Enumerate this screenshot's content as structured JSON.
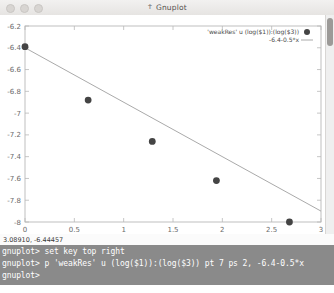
{
  "window": {
    "title": "Gnuplot",
    "icon": "gnuplot-icon",
    "traffic_lights": [
      "close",
      "minimize",
      "maximize"
    ]
  },
  "coord_readout": "3.08910, -6.44457",
  "terminal": {
    "lines": [
      "gnuplot> set key top right",
      "gnuplot> p 'weakRes' u (log($1)):(log($3)) pt 7 ps 2, -6.4-0.5*x",
      "gnuplot>"
    ]
  },
  "chart_data": {
    "type": "scatter",
    "title": "",
    "xlabel": "",
    "ylabel": "",
    "xlim": [
      0,
      3
    ],
    "ylim": [
      -8,
      -6.2
    ],
    "xticks": [
      "0",
      "0.5",
      "1",
      "1.5",
      "2",
      "2.5",
      "3"
    ],
    "xtick_values": [
      0,
      0.5,
      1,
      1.5,
      2,
      2.5,
      3
    ],
    "yticks": [
      "-6.2",
      "-6.4",
      "-6.6",
      "-6.8",
      "-7",
      "-7.2",
      "-7.4",
      "-7.6",
      "-7.8",
      "-8"
    ],
    "ytick_values": [
      -6.2,
      -6.4,
      -6.6,
      -6.8,
      -7,
      -7.2,
      -7.4,
      -7.6,
      -7.8,
      -8
    ],
    "grid": false,
    "legend_position": "top right",
    "point_color": "#444444",
    "line_color": "#aaaaaa",
    "axis_color": "#b8b8b8",
    "series": [
      {
        "name": "'weakRes' u (log($1)):(log($3))",
        "type": "scatter",
        "marker": "filled-circle",
        "pointtype": 7,
        "pointsize": 2,
        "x": [
          0.0,
          0.64,
          1.29,
          1.94,
          2.68
        ],
        "y": [
          -6.39,
          -6.88,
          -7.26,
          -7.62,
          -8.0
        ]
      },
      {
        "name": "-6.4-0.5*x",
        "type": "line",
        "intercept": -6.4,
        "slope": -0.5,
        "x": [
          0,
          3
        ],
        "y": [
          -6.4,
          -7.9
        ]
      }
    ]
  }
}
